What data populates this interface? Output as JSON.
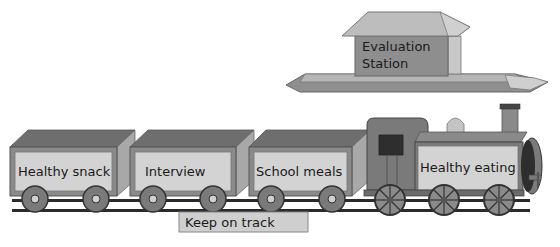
{
  "diagram": {
    "station": {
      "line1": "Evaluation",
      "line2": "Station"
    },
    "wagons": [
      {
        "label": "Healthy snack"
      },
      {
        "label": "Interview"
      },
      {
        "label": "School meals"
      }
    ],
    "engine": {
      "label": "Healthy eating"
    },
    "track_sign": {
      "label": "Keep on track"
    },
    "colors": {
      "wagon_panel": "#d3d3d3",
      "wagon_body": "#8a8a8a",
      "wagon_inside": "#6e6e6e",
      "engine_body": "#7a7a7a",
      "rail": "#2a2a2a",
      "station_platform": "#9a9a9a",
      "station_roof": "#bdbdbd"
    }
  }
}
